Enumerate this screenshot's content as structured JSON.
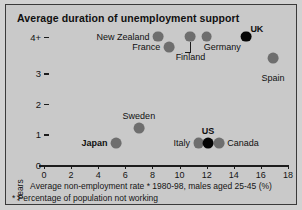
{
  "chart_data": {
    "type": "scatter",
    "title": "Average duration of unemployment support",
    "xlabel": "Average non-employment rate * 1980-98, males aged 25-45 (%)",
    "ylabel": "Years",
    "footnote": "* Percentage of population not working",
    "xlim": [
      0,
      18
    ],
    "ylim": [
      0,
      4.35
    ],
    "grid": false,
    "legend": "none",
    "xticks": [
      0,
      2,
      4,
      6,
      8,
      10,
      12,
      14,
      16,
      18
    ],
    "xtick_labels": [
      "0",
      "2",
      "4",
      "6",
      "8",
      "10",
      "12",
      "14",
      "16",
      "18"
    ],
    "yticks": [
      0,
      1,
      2,
      3,
      4
    ],
    "ytick_labels": [
      "0",
      "1",
      "2",
      "3",
      "4+"
    ],
    "points": [
      {
        "name": "New Zealand",
        "x": 8.4,
        "y": 4.2,
        "color": "#6e6e6e",
        "highlight": false,
        "label_pos": "left",
        "bold": false
      },
      {
        "name": "France",
        "x": 9.2,
        "y": 3.85,
        "color": "#6e6e6e",
        "highlight": false,
        "label_pos": "left",
        "bold": false
      },
      {
        "name": "Finland",
        "x": 10.8,
        "y": 4.2,
        "color": "#6e6e6e",
        "highlight": false,
        "label_pos": "below",
        "bold": false
      },
      {
        "name": "Germany",
        "x": 12.0,
        "y": 4.2,
        "color": "#6e6e6e",
        "highlight": false,
        "label_pos": "below-right",
        "bold": false
      },
      {
        "name": "UK",
        "x": 14.9,
        "y": 4.2,
        "color": "#050505",
        "highlight": true,
        "label_pos": "upper-right",
        "bold": true
      },
      {
        "name": "Spain",
        "x": 16.9,
        "y": 3.5,
        "color": "#6e6e6e",
        "highlight": false,
        "label_pos": "below",
        "bold": false
      },
      {
        "name": "Sweden",
        "x": 7.0,
        "y": 1.2,
        "color": "#6e6e6e",
        "highlight": false,
        "label_pos": "above",
        "bold": false
      },
      {
        "name": "Japan",
        "x": 5.3,
        "y": 0.72,
        "color": "#6e6e6e",
        "highlight": false,
        "label_pos": "left",
        "bold": true
      },
      {
        "name": "Italy",
        "x": 11.4,
        "y": 0.72,
        "color": "#6e6e6e",
        "highlight": false,
        "label_pos": "left",
        "bold": false
      },
      {
        "name": "US",
        "x": 12.1,
        "y": 0.72,
        "color": "#050505",
        "highlight": true,
        "label_pos": "above",
        "bold": true
      },
      {
        "name": "Canada",
        "x": 12.9,
        "y": 0.72,
        "color": "#6e6e6e",
        "highlight": false,
        "label_pos": "right",
        "bold": false
      }
    ]
  },
  "colors": {
    "panel_background": "#c9c9c9",
    "page_background": "#d2d2d2",
    "border": "#3a3a3a",
    "marker_default": "#6e6e6e",
    "marker_highlight": "#050505",
    "text": "#101010"
  }
}
